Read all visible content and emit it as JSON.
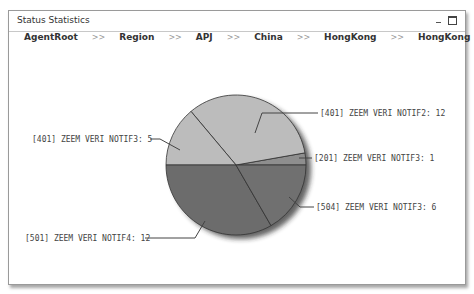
{
  "window": {
    "title": "Status Statistics",
    "controls": {
      "minimize": "minimize-icon",
      "maximize": "maximize-icon"
    }
  },
  "breadcrumb": {
    "items": [
      "AgentRoot",
      "Region",
      "APJ",
      "China",
      "HongKong",
      "HongKong"
    ],
    "separator": ">>"
  },
  "chart_data": {
    "type": "pie",
    "title": "",
    "total": 36,
    "slices": [
      {
        "label": "[201] ZEEM VERI NOTIF3: 1",
        "name": "[201] ZEEM VERI NOTIF3",
        "value": 1,
        "color": "#8e8e8e"
      },
      {
        "label": "[401] ZEEM VERI NOTIF2: 12",
        "name": "[401] ZEEM VERI NOTIF2",
        "value": 12,
        "color": "#bcbcbc"
      },
      {
        "label": "[401] ZEEM VERI NOTIF3: 5",
        "name": "[401] ZEEM VERI NOTIF3",
        "value": 5,
        "color": "#bcbcbc"
      },
      {
        "label": "[501] ZEEM VERI NOTIF4: 12",
        "name": "[501] ZEEM VERI NOTIF4",
        "value": 12,
        "color": "#6c6c6c"
      },
      {
        "label": "[504] ZEEM VERI NOTIF3: 6",
        "name": "[504] ZEEM VERI NOTIF3",
        "value": 6,
        "color": "#707070"
      }
    ],
    "legend": "callout labels",
    "grid": false
  }
}
